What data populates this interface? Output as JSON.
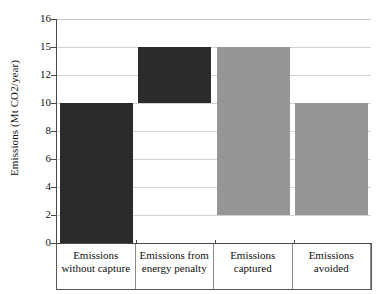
{
  "chart_data": {
    "type": "bar",
    "subtype": "waterfall",
    "title": "",
    "xlabel": "",
    "ylabel": "Emissions (Mt CO2/year)",
    "categories": [
      "Emissions without capture",
      "Emissions from energy penalty",
      "Emissions captured",
      "Emissions avoided"
    ],
    "category_lines": [
      [
        "Emissions",
        "without capture"
      ],
      [
        "Emissions from",
        "energy penalty"
      ],
      [
        "Emissions",
        "captured"
      ],
      [
        "Emissions",
        "avoided"
      ]
    ],
    "ytick_labels": [
      "0",
      "2",
      "4",
      "6",
      "8",
      "10",
      "12",
      "15",
      "16"
    ],
    "ytick_values": [
      0,
      2,
      4,
      6,
      8,
      10,
      12,
      15,
      16
    ],
    "ylim": [
      0,
      16
    ],
    "grid": true,
    "legend": "none",
    "bars": [
      {
        "label": "Emissions without capture",
        "base": 0,
        "top": 10,
        "value": 10,
        "color": "#2b2b2b"
      },
      {
        "label": "Emissions from energy penalty",
        "base": 10,
        "top": 15,
        "value": 5,
        "color": "#2b2b2b"
      },
      {
        "label": "Emissions captured",
        "base": 2,
        "top": 15,
        "value": 13,
        "color": "#969696"
      },
      {
        "label": "Emissions avoided",
        "base": 2,
        "top": 10,
        "value": 8,
        "color": "#969696"
      }
    ],
    "series": [
      {
        "name": "bar base",
        "values": [
          0,
          10,
          2,
          2
        ]
      },
      {
        "name": "bar top",
        "values": [
          10,
          15,
          15,
          10
        ]
      }
    ],
    "colors": {
      "dark_bar": "#2b2b2b",
      "light_bar": "#969696",
      "grid": "#d2d2d2",
      "axis": "#4a4a4a"
    }
  }
}
